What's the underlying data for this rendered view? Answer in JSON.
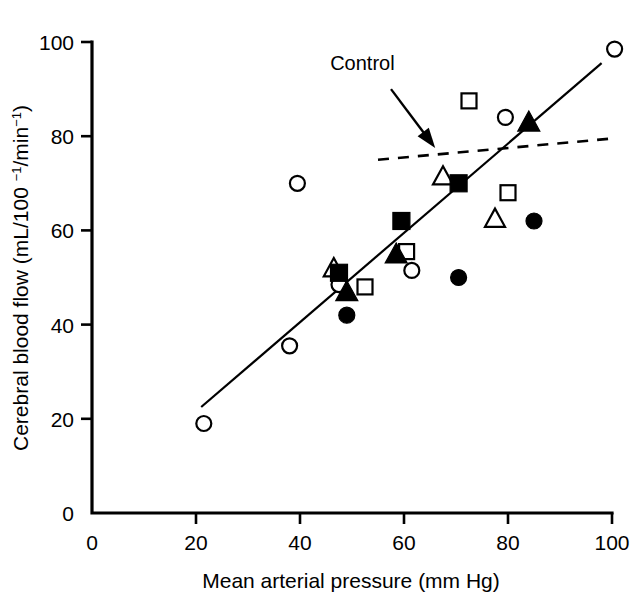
{
  "chart_data": {
    "type": "scatter",
    "title": "",
    "xlabel": "Mean arterial pressure (mm Hg)",
    "ylabel": "Cerebral blood flow (mL/100 −1/min−1)",
    "ylabel_parts": {
      "prefix": "Cerebral blood flow (mL/100 ",
      "sup1": "−1",
      "middle": "/min",
      "sup2": "−1",
      "suffix": ")"
    },
    "xlim": [
      0,
      100
    ],
    "ylim": [
      0,
      100
    ],
    "xticks": [
      0,
      20,
      40,
      60,
      80,
      100
    ],
    "yticks": [
      0,
      20,
      40,
      60,
      80,
      100
    ],
    "xtick_labels": [
      "0",
      "20",
      "40",
      "60",
      "80",
      "100"
    ],
    "ytick_labels": [
      "0",
      "20",
      "40",
      "60",
      "80",
      "100"
    ],
    "grid": false,
    "legend": "none",
    "annotations": [
      {
        "name": "control-annotation",
        "text": "Control",
        "text_x": 52.0,
        "text_y": 94.0,
        "arrow_from_x": 57.5,
        "arrow_from_y": 90.0,
        "arrow_to_x": 66.0,
        "arrow_to_y": 77.5
      }
    ],
    "series": [
      {
        "name": "open-circle",
        "marker": "open-circle",
        "points": [
          {
            "x": 21.5,
            "y": 19.0
          },
          {
            "x": 38.0,
            "y": 35.5
          },
          {
            "x": 39.5,
            "y": 70.0
          },
          {
            "x": 47.5,
            "y": 48.5
          },
          {
            "x": 61.5,
            "y": 51.5
          },
          {
            "x": 79.5,
            "y": 84.0
          },
          {
            "x": 100.5,
            "y": 98.5
          }
        ]
      },
      {
        "name": "filled-circle",
        "marker": "filled-circle",
        "points": [
          {
            "x": 49.0,
            "y": 42.0
          },
          {
            "x": 70.5,
            "y": 50.0
          },
          {
            "x": 85.0,
            "y": 62.0
          }
        ]
      },
      {
        "name": "open-square",
        "marker": "open-square",
        "points": [
          {
            "x": 52.5,
            "y": 48.0
          },
          {
            "x": 60.5,
            "y": 55.5
          },
          {
            "x": 72.5,
            "y": 87.5
          },
          {
            "x": 80.0,
            "y": 68.0
          }
        ]
      },
      {
        "name": "filled-square",
        "marker": "filled-square",
        "points": [
          {
            "x": 47.5,
            "y": 51.0
          },
          {
            "x": 59.5,
            "y": 62.0
          },
          {
            "x": 70.5,
            "y": 70.0
          }
        ]
      },
      {
        "name": "open-triangle",
        "marker": "open-triangle",
        "points": [
          {
            "x": 46.5,
            "y": 52.0
          },
          {
            "x": 67.5,
            "y": 71.5
          },
          {
            "x": 77.5,
            "y": 62.5
          }
        ]
      },
      {
        "name": "filled-triangle",
        "marker": "filled-triangle",
        "points": [
          {
            "x": 49.0,
            "y": 47.0
          },
          {
            "x": 58.5,
            "y": 55.0
          },
          {
            "x": 84.0,
            "y": 83.0
          }
        ]
      }
    ],
    "regression_line": {
      "name": "solid-fit-line",
      "style": "solid",
      "x0": 21.0,
      "y0": 22.5,
      "x1": 98.0,
      "y1": 95.5
    },
    "control_line": {
      "name": "control-dashed-line",
      "style": "dashed",
      "label": "Control",
      "x0": 55.0,
      "y0": 75.0,
      "x1": 100.0,
      "y1": 79.5
    }
  },
  "colors": {
    "foreground": "#000000",
    "background": "#ffffff"
  }
}
